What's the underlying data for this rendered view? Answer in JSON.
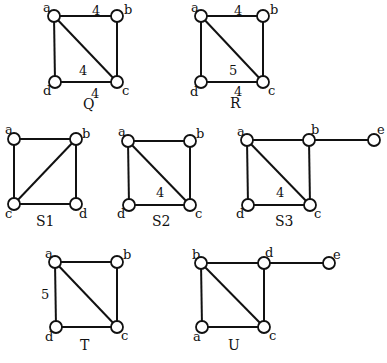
{
  "graphs": [
    {
      "name": "Q",
      "caption": {
        "text": "Q",
        "x": 83,
        "y": 109
      },
      "nodes": [
        {
          "id": "a",
          "x": 54,
          "y": 16,
          "lx": 43,
          "ly": 12
        },
        {
          "id": "b",
          "x": 117,
          "y": 16,
          "lx": 124,
          "ly": 14
        },
        {
          "id": "c",
          "x": 117,
          "y": 82,
          "lx": 122,
          "ly": 95
        },
        {
          "id": "d",
          "x": 55,
          "y": 82,
          "lx": 43,
          "ly": 95
        }
      ],
      "edges": [
        [
          "a",
          "b"
        ],
        [
          "b",
          "c"
        ],
        [
          "c",
          "d"
        ],
        [
          "d",
          "a"
        ],
        [
          "a",
          "c"
        ]
      ],
      "weights": [
        {
          "text": "4",
          "x": 92,
          "y": 15
        },
        {
          "text": "4",
          "x": 79,
          "y": 75
        },
        {
          "text": "4",
          "x": 91,
          "y": 98
        }
      ]
    },
    {
      "name": "R",
      "caption": {
        "text": "R",
        "x": 230,
        "y": 108
      },
      "nodes": [
        {
          "id": "a",
          "x": 201,
          "y": 16,
          "lx": 191,
          "ly": 12
        },
        {
          "id": "b",
          "x": 263,
          "y": 16,
          "lx": 270,
          "ly": 14
        },
        {
          "id": "c",
          "x": 263,
          "y": 82,
          "lx": 268,
          "ly": 95
        },
        {
          "id": "d",
          "x": 201,
          "y": 82,
          "lx": 190,
          "ly": 96
        }
      ],
      "edges": [
        [
          "a",
          "b"
        ],
        [
          "b",
          "c"
        ],
        [
          "c",
          "d"
        ],
        [
          "d",
          "a"
        ],
        [
          "a",
          "c"
        ]
      ],
      "weights": [
        {
          "text": "4",
          "x": 234,
          "y": 15
        },
        {
          "text": "5",
          "x": 229,
          "y": 75
        },
        {
          "text": "4",
          "x": 234,
          "y": 96
        }
      ]
    },
    {
      "name": "S1",
      "caption": {
        "text": "S1",
        "x": 36,
        "y": 226
      },
      "nodes": [
        {
          "id": "a",
          "x": 14,
          "y": 139,
          "lx": 5,
          "ly": 134
        },
        {
          "id": "b",
          "x": 76,
          "y": 139,
          "lx": 82,
          "ly": 138
        },
        {
          "id": "c",
          "x": 14,
          "y": 204,
          "lx": 5,
          "ly": 218
        },
        {
          "id": "d",
          "x": 76,
          "y": 204,
          "lx": 79,
          "ly": 218
        }
      ],
      "edges": [
        [
          "a",
          "b"
        ],
        [
          "b",
          "d"
        ],
        [
          "d",
          "c"
        ],
        [
          "c",
          "a"
        ],
        [
          "b",
          "c"
        ]
      ],
      "weights": []
    },
    {
      "name": "S2",
      "caption": {
        "text": "S2",
        "x": 152,
        "y": 226
      },
      "nodes": [
        {
          "id": "a",
          "x": 128,
          "y": 141,
          "lx": 118,
          "ly": 136
        },
        {
          "id": "b",
          "x": 190,
          "y": 141,
          "lx": 196,
          "ly": 138
        },
        {
          "id": "c",
          "x": 190,
          "y": 205,
          "lx": 195,
          "ly": 218
        },
        {
          "id": "d",
          "x": 129,
          "y": 205,
          "lx": 117,
          "ly": 218
        }
      ],
      "edges": [
        [
          "a",
          "b"
        ],
        [
          "b",
          "c"
        ],
        [
          "c",
          "d"
        ],
        [
          "d",
          "a"
        ],
        [
          "a",
          "c"
        ]
      ],
      "weights": [
        {
          "text": "4",
          "x": 156,
          "y": 197
        }
      ]
    },
    {
      "name": "S3",
      "caption": {
        "text": "S3",
        "x": 275,
        "y": 226
      },
      "nodes": [
        {
          "id": "a",
          "x": 247,
          "y": 140,
          "lx": 237,
          "ly": 136
        },
        {
          "id": "b",
          "x": 309,
          "y": 140,
          "lx": 311,
          "ly": 134
        },
        {
          "id": "c",
          "x": 310,
          "y": 205,
          "lx": 314,
          "ly": 218
        },
        {
          "id": "d",
          "x": 248,
          "y": 205,
          "lx": 236,
          "ly": 218
        },
        {
          "id": "e",
          "x": 374,
          "y": 140,
          "lx": 377,
          "ly": 134
        }
      ],
      "edges": [
        [
          "a",
          "b"
        ],
        [
          "b",
          "c"
        ],
        [
          "c",
          "d"
        ],
        [
          "d",
          "a"
        ],
        [
          "a",
          "c"
        ],
        [
          "b",
          "e"
        ]
      ],
      "weights": [
        {
          "text": "4",
          "x": 276,
          "y": 197
        }
      ]
    },
    {
      "name": "T",
      "caption": {
        "text": "T",
        "x": 80,
        "y": 350
      },
      "nodes": [
        {
          "id": "a",
          "x": 55,
          "y": 262,
          "lx": 45,
          "ly": 258
        },
        {
          "id": "b",
          "x": 117,
          "y": 262,
          "lx": 123,
          "ly": 259
        },
        {
          "id": "c",
          "x": 117,
          "y": 327,
          "lx": 121,
          "ly": 340
        },
        {
          "id": "d",
          "x": 56,
          "y": 327,
          "lx": 45,
          "ly": 341
        }
      ],
      "edges": [
        [
          "a",
          "b"
        ],
        [
          "b",
          "c"
        ],
        [
          "c",
          "d"
        ],
        [
          "d",
          "a"
        ],
        [
          "a",
          "c"
        ]
      ],
      "weights": [
        {
          "text": "5",
          "x": 41,
          "y": 299
        }
      ]
    },
    {
      "name": "U",
      "caption": {
        "text": "U",
        "x": 228,
        "y": 350
      },
      "nodes": [
        {
          "id": "b",
          "x": 201,
          "y": 263,
          "lx": 192,
          "ly": 259
        },
        {
          "id": "d",
          "x": 264,
          "y": 263,
          "lx": 265,
          "ly": 257
        },
        {
          "id": "e",
          "x": 329,
          "y": 263,
          "lx": 333,
          "ly": 259
        },
        {
          "id": "a",
          "x": 202,
          "y": 327,
          "lx": 193,
          "ly": 341
        },
        {
          "id": "c",
          "x": 264,
          "y": 327,
          "lx": 269,
          "ly": 340
        }
      ],
      "edges": [
        [
          "b",
          "d"
        ],
        [
          "d",
          "c"
        ],
        [
          "c",
          "a"
        ],
        [
          "a",
          "b"
        ],
        [
          "b",
          "c"
        ],
        [
          "d",
          "e"
        ]
      ],
      "weights": []
    }
  ],
  "style": {
    "stroke": "#111111",
    "node_fill": "#ffffff",
    "background": "#ffffff",
    "node_radius": 6
  }
}
